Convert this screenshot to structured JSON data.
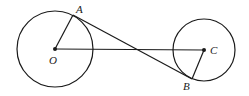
{
  "diagram": {
    "labels": {
      "A": "A",
      "O": "O",
      "C": "C",
      "B": "B"
    },
    "circle_O": {
      "cx": 55,
      "cy": 49,
      "r": 38
    },
    "circle_C": {
      "cx": 204,
      "cy": 50,
      "r": 31
    },
    "points": {
      "A": [
        73,
        15
      ],
      "B": [
        192,
        79
      ],
      "O": [
        55,
        49
      ],
      "C": [
        204,
        50
      ]
    },
    "stroke": "#1a1a1a"
  }
}
